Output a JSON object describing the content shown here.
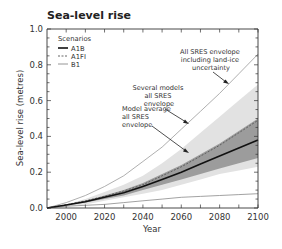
{
  "chart_data": {
    "type": "area",
    "title": "Sea-level rise",
    "xlabel": "Year",
    "ylabel": "Sea-level rise (metres)",
    "xlim": [
      1990,
      2100
    ],
    "ylim": [
      0.0,
      1.0
    ],
    "x_ticks": [
      2000,
      2020,
      2040,
      2060,
      2080,
      2100
    ],
    "y_ticks": [
      0.0,
      0.2,
      0.4,
      0.6,
      0.8,
      1.0
    ],
    "x_tick_labels": [
      "2000",
      "2020",
      "2040",
      "2060",
      "2080",
      "2100"
    ],
    "y_tick_labels": [
      "0.0",
      "0.2",
      "0.4",
      "0.6",
      "0.8",
      "1.0"
    ],
    "grid": false,
    "legend": {
      "title": "Scenarios",
      "position": "upper-left",
      "entries": [
        {
          "label": "A1B",
          "style": "solid-thick"
        },
        {
          "label": "A1FI",
          "style": "dashed"
        },
        {
          "label": "B1",
          "style": "solid-thin"
        }
      ]
    },
    "x": [
      1990,
      2000,
      2010,
      2020,
      2030,
      2040,
      2050,
      2060,
      2070,
      2080,
      2090,
      2100
    ],
    "series": [
      {
        "name": "All SRES envelope including land-ice uncertainty (upper)",
        "values": [
          0.0,
          0.03,
          0.07,
          0.12,
          0.18,
          0.26,
          0.34,
          0.44,
          0.54,
          0.64,
          0.75,
          0.86
        ]
      },
      {
        "name": "All SRES envelope including land-ice uncertainty (lower)",
        "values": [
          0.0,
          0.01,
          0.015,
          0.02,
          0.03,
          0.04,
          0.05,
          0.06,
          0.065,
          0.07,
          0.075,
          0.08
        ]
      },
      {
        "name": "Several models all SRES envelope (upper)",
        "values": [
          0.0,
          0.02,
          0.05,
          0.09,
          0.13,
          0.18,
          0.25,
          0.33,
          0.42,
          0.51,
          0.6,
          0.69
        ]
      },
      {
        "name": "Several models all SRES envelope (lower)",
        "values": [
          0.0,
          0.01,
          0.02,
          0.04,
          0.06,
          0.08,
          0.1,
          0.13,
          0.16,
          0.19,
          0.21,
          0.23
        ]
      },
      {
        "name": "Model average all SRES envelope (upper)",
        "values": [
          0.0,
          0.02,
          0.04,
          0.07,
          0.1,
          0.14,
          0.19,
          0.24,
          0.3,
          0.36,
          0.43,
          0.5
        ]
      },
      {
        "name": "Model average all SRES envelope (lower)",
        "values": [
          0.0,
          0.015,
          0.03,
          0.05,
          0.07,
          0.1,
          0.13,
          0.16,
          0.19,
          0.22,
          0.25,
          0.28
        ]
      },
      {
        "name": "A1B",
        "values": [
          0.0,
          0.017,
          0.035,
          0.06,
          0.085,
          0.12,
          0.16,
          0.2,
          0.245,
          0.29,
          0.335,
          0.38
        ]
      },
      {
        "name": "A1FI",
        "values": [
          0.0,
          0.018,
          0.04,
          0.065,
          0.095,
          0.13,
          0.18,
          0.23,
          0.29,
          0.35,
          0.42,
          0.49
        ]
      },
      {
        "name": "B1",
        "values": [
          0.0,
          0.01,
          0.015,
          0.02,
          0.03,
          0.04,
          0.05,
          0.06,
          0.065,
          0.07,
          0.075,
          0.08
        ]
      }
    ],
    "annotations": [
      {
        "text": [
          "All SRES envelope",
          "including land-ice",
          "uncertainty"
        ],
        "points_to": "outer envelope upper line"
      },
      {
        "text": [
          "Several models",
          "all SRES",
          "envelope"
        ],
        "points_to": "light grey envelope"
      },
      {
        "text": [
          "Model average",
          "all SRES",
          "envelope"
        ],
        "points_to": "dark grey envelope"
      }
    ],
    "colors": {
      "outer_line": "#9a9a9a",
      "light_envelope": "#e2e2e2",
      "dark_envelope": "#9c9c9c",
      "a1b": "#111111",
      "a1fi": "#555555",
      "b1": "#8a8a8a",
      "axis": "#333333"
    }
  }
}
